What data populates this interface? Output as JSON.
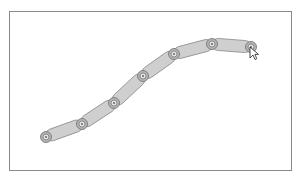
{
  "canvas": {
    "border_color": "#8a8a8a",
    "background": "#ffffff"
  },
  "chain": {
    "link_fill": "#cfcfcf",
    "link_stroke": "#8c8c8c",
    "joint_outer_fill": "#b5b5b5",
    "joint_stroke": "#6e6e6e",
    "link_width": 12,
    "joints": [
      {
        "x": 46,
        "y": 137
      },
      {
        "x": 82,
        "y": 124
      },
      {
        "x": 114,
        "y": 103
      },
      {
        "x": 143,
        "y": 76
      },
      {
        "x": 174,
        "y": 54
      },
      {
        "x": 212,
        "y": 44
      },
      {
        "x": 251,
        "y": 47
      }
    ]
  },
  "cursor": {
    "icon": "arrow-cursor-icon",
    "x": 250,
    "y": 47
  }
}
